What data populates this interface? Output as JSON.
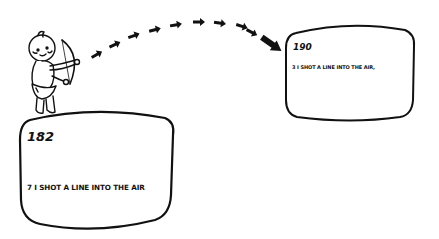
{
  "illustration": {
    "description": "Cupid shooting arrows from one screen to another",
    "figure": "cherub-archer",
    "colors": {
      "ink": "#111111",
      "background": "#ffffff"
    }
  },
  "screens": [
    {
      "id": "source",
      "number": "182",
      "line": "7 I SHOT A LINE INTO THE AIR"
    },
    {
      "id": "target",
      "number": "190",
      "line": "3 I SHOT A LINE INTO THE AIR,"
    }
  ],
  "arrows": {
    "count": 9,
    "direction": "left-to-right arc"
  }
}
